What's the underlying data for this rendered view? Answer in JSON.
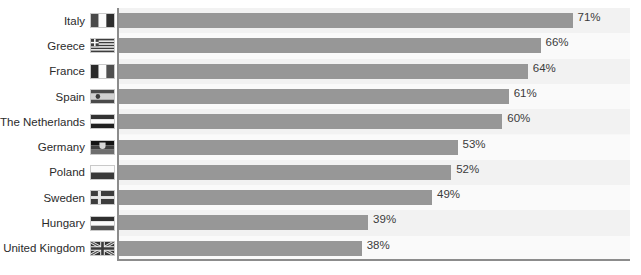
{
  "chart_data": {
    "type": "bar",
    "orientation": "horizontal",
    "title": "",
    "subtitle": "",
    "xlabel": "",
    "ylabel": "",
    "xlim": [
      0,
      80
    ],
    "grid": false,
    "legend": false,
    "value_suffix": "%",
    "categories": [
      "Italy",
      "Greece",
      "France",
      "Spain",
      "The Netherlands",
      "Germany",
      "Poland",
      "Sweden",
      "Hungary",
      "United Kingdom"
    ],
    "values": [
      71,
      66,
      64,
      61,
      60,
      53,
      52,
      49,
      39,
      38
    ],
    "data_labels": [
      "71%",
      "66%",
      "64%",
      "61%",
      "60%",
      "53%",
      "52%",
      "49%",
      "39%",
      "38%"
    ],
    "series": [
      {
        "name": "",
        "values": [
          71,
          66,
          64,
          61,
          60,
          53,
          52,
          49,
          39,
          38
        ]
      }
    ],
    "colors": {
      "bar": "#979797",
      "plot_background": "#f7f7f7",
      "band_a": "#f2f2f2",
      "band_b": "#fafafa",
      "axis_line": "#8c8c8c",
      "label_text": "#2b2b2b",
      "value_text": "#3b3b3b"
    },
    "flags": [
      "italy-flag-icon",
      "greece-flag-icon",
      "france-flag-icon",
      "spain-flag-icon",
      "netherlands-flag-icon",
      "germany-flag-icon",
      "poland-flag-icon",
      "sweden-flag-icon",
      "hungary-flag-icon",
      "united-kingdom-flag-icon"
    ]
  },
  "watermark": {
    "text": "view preview"
  }
}
